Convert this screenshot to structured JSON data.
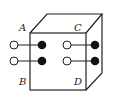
{
  "diagram": {
    "type": "cube-with-dumbbells",
    "colors": {
      "stroke": "#222222",
      "fill_dark": "#111111",
      "fill_light": "#ffffff"
    },
    "labels": [
      {
        "id": "A",
        "text": "A",
        "x": 19,
        "y": 31
      },
      {
        "id": "C",
        "text": "C",
        "x": 74,
        "y": 31
      },
      {
        "id": "B",
        "text": "B",
        "x": 19,
        "y": 85
      },
      {
        "id": "D",
        "text": "D",
        "x": 74,
        "y": 85
      }
    ],
    "dumbbells": [
      {
        "id": "A",
        "open": {
          "x": 14,
          "y": 45
        },
        "filled": {
          "x": 42,
          "y": 45
        }
      },
      {
        "id": "B",
        "open": {
          "x": 14,
          "y": 61
        },
        "filled": {
          "x": 42,
          "y": 61
        }
      },
      {
        "id": "C",
        "open": {
          "x": 67,
          "y": 45
        },
        "filled": {
          "x": 95,
          "y": 45
        }
      },
      {
        "id": "D",
        "open": {
          "x": 67,
          "y": 61
        },
        "filled": {
          "x": 95,
          "y": 61
        }
      }
    ]
  }
}
